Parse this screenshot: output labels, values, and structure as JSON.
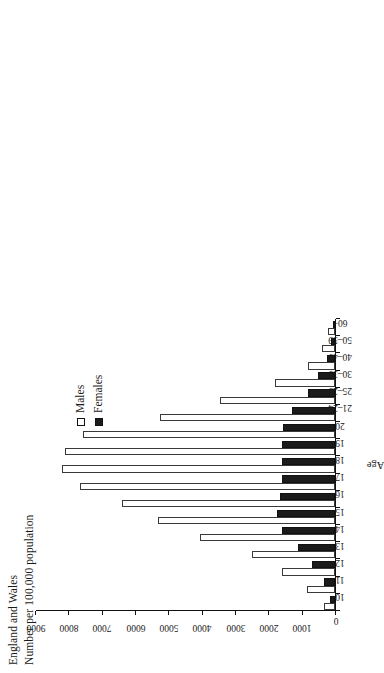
{
  "figure": {
    "title_line_1": "England and Wales",
    "title_line_2": "Number per 100,000 population"
  },
  "legend": {
    "position": "top-right",
    "items": [
      {
        "label": "Males",
        "swatch": "open-square-icon",
        "color": "#ffffff"
      },
      {
        "label": "Females",
        "swatch": "filled-square-icon",
        "color": "#1b1b1b"
      }
    ]
  },
  "axes": {
    "value_axis": {
      "ticks": [
        "9000",
        "8000",
        "7000",
        "6000",
        "5000",
        "4000",
        "3000",
        "2000",
        "1000",
        "0"
      ],
      "min": 0,
      "max": 9000
    },
    "category_axis": {
      "title": "Age"
    }
  },
  "chart_data": {
    "type": "bar",
    "title": "England and Wales\nNumber per 100,000 population",
    "xlabel": "Age",
    "ylabel": "Number per 100,000 population",
    "ylim": [
      0,
      9000
    ],
    "yticks": [
      0,
      1000,
      2000,
      3000,
      4000,
      5000,
      6000,
      7000,
      8000,
      9000
    ],
    "grid": false,
    "legend_position": "top-right",
    "orientation": "vertical-bars-rotated-90ccw",
    "categories": [
      "10",
      "11",
      "12",
      "13",
      "14",
      "15",
      "16",
      "17",
      "18",
      "19",
      "20",
      "21–24",
      "25–29",
      "30–39",
      "40–49",
      "50–59",
      "60+"
    ],
    "series": [
      {
        "name": "Males",
        "color": "#ffffff",
        "values": [
          330,
          850,
          1600,
          2500,
          4050,
          5300,
          6400,
          7650,
          8200,
          8100,
          7550,
          5250,
          3450,
          1800,
          800,
          400,
          200
        ]
      },
      {
        "name": "Females",
        "color": "#1b1b1b",
        "values": [
          160,
          330,
          700,
          1100,
          1600,
          1750,
          1650,
          1600,
          1600,
          1600,
          1550,
          1300,
          800,
          500,
          250,
          120,
          60
        ]
      }
    ]
  }
}
